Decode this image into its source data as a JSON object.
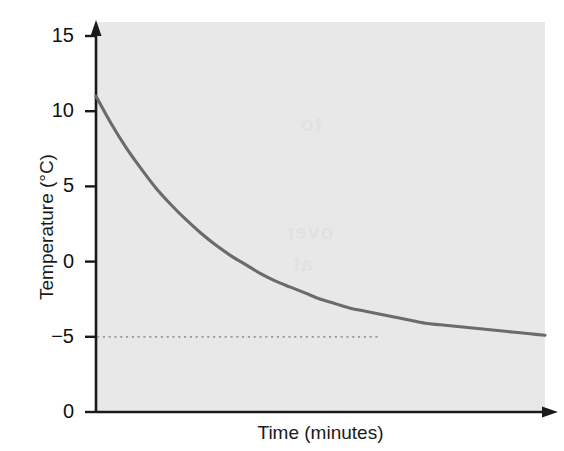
{
  "figure": {
    "background_color": "#ffffff",
    "plot_background_color": "#e8e8e8",
    "curve_color": "#6b6b6b",
    "axis_color": "#1a1a1a",
    "dotted_line_color": "#9a9a9a"
  },
  "ghost_text": {
    "line1": "to",
    "line2": "over",
    "line3": "at"
  },
  "chart_data": {
    "type": "line",
    "title": "",
    "subtitle": "",
    "xlabel": "Time (minutes)",
    "ylabel": "Temperature (°C)",
    "xlim": [
      0,
      30
    ],
    "ylim": [
      -10,
      15
    ],
    "grid": false,
    "legend": null,
    "x_tick_labels": [],
    "y_tick_labels": [
      "15",
      "10",
      "5",
      "0",
      "−5",
      "0"
    ],
    "y_tick_values": [
      15,
      10,
      5,
      0,
      -5,
      -10
    ],
    "annotations": [
      {
        "name": "asymptote-line",
        "type": "horizontal-dotted-line",
        "y": -5,
        "label": "−5"
      }
    ],
    "series": [
      {
        "name": "Cooling curve",
        "color": "#6b6b6b",
        "description": "Exponential decay of temperature from 11 °C toward an asymptote of −5 °C",
        "start_value": 11,
        "asymptote": -5,
        "x": [
          0,
          1,
          2,
          3,
          4,
          5,
          6,
          7,
          8,
          9,
          10,
          11,
          12,
          13,
          14,
          15,
          16,
          17,
          18,
          19,
          20,
          21,
          22,
          23,
          24,
          25,
          26,
          27,
          28,
          29,
          30
        ],
        "y": [
          11.0,
          9.2,
          7.6,
          6.2,
          4.9,
          3.8,
          2.8,
          1.9,
          1.1,
          0.4,
          -0.2,
          -0.8,
          -1.3,
          -1.7,
          -2.1,
          -2.5,
          -2.8,
          -3.1,
          -3.3,
          -3.5,
          -3.7,
          -3.9,
          -4.1,
          -4.2,
          -4.3,
          -4.4,
          -4.5,
          -4.6,
          -4.7,
          -4.8,
          -4.9
        ]
      }
    ]
  }
}
